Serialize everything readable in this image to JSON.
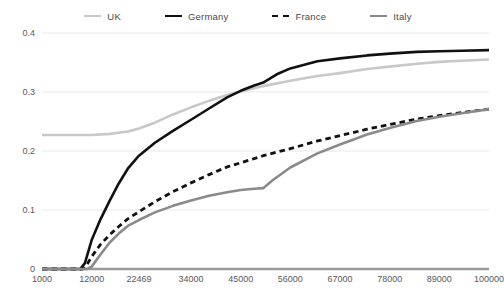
{
  "chart_data": {
    "type": "line",
    "title": "",
    "xlabel": "",
    "ylabel": "",
    "grid": true,
    "legend_position": "top",
    "xlim": [
      1000,
      100000
    ],
    "ylim": [
      0,
      0.4
    ],
    "xticks": [
      "1000",
      "12000",
      "22469",
      "34000",
      "45000",
      "56000",
      "67000",
      "78000",
      "89000",
      "100000"
    ],
    "xtick_values": [
      1000,
      12000,
      22469,
      34000,
      45000,
      56000,
      67000,
      78000,
      89000,
      100000
    ],
    "yticks": [
      "0",
      "0.1",
      "0.2",
      "0.3",
      "0.4"
    ],
    "ytick_values": [
      0,
      0.1,
      0.2,
      0.3,
      0.4
    ],
    "series": [
      {
        "name": "UK",
        "color": "#c8c8c8",
        "style": "solid",
        "width": 2.6,
        "x": [
          1000,
          8000,
          12000,
          16000,
          20000,
          22469,
          26000,
          30000,
          34000,
          38000,
          42000,
          45000,
          50000,
          56000,
          62000,
          67000,
          73000,
          78000,
          84000,
          89000,
          94000,
          100000
        ],
        "y": [
          0.227,
          0.227,
          0.227,
          0.229,
          0.233,
          0.238,
          0.248,
          0.262,
          0.274,
          0.285,
          0.295,
          0.301,
          0.31,
          0.319,
          0.327,
          0.332,
          0.339,
          0.343,
          0.348,
          0.351,
          0.353,
          0.355
        ]
      },
      {
        "name": "Germany",
        "color": "#111111",
        "style": "solid",
        "width": 2.6,
        "x": [
          1000,
          9500,
          10500,
          12000,
          14000,
          16000,
          18000,
          20000,
          22469,
          26000,
          30000,
          34000,
          38000,
          42000,
          45000,
          48000,
          50000,
          53000,
          56000,
          62000,
          67000,
          73000,
          78000,
          84000,
          89000,
          94000,
          100000
        ],
        "y": [
          0.0,
          0.0,
          0.01,
          0.049,
          0.085,
          0.116,
          0.145,
          0.17,
          0.192,
          0.214,
          0.234,
          0.253,
          0.272,
          0.291,
          0.302,
          0.311,
          0.316,
          0.33,
          0.34,
          0.352,
          0.357,
          0.362,
          0.365,
          0.368,
          0.369,
          0.37,
          0.371
        ]
      },
      {
        "name": "France",
        "color": "#111111",
        "style": "dashed",
        "width": 2.8,
        "x": [
          1000,
          10000,
          11000,
          12000,
          14000,
          16000,
          18000,
          20000,
          22469,
          26000,
          30000,
          34000,
          38000,
          42000,
          45000,
          50000,
          56000,
          62000,
          67000,
          73000,
          78000,
          84000,
          89000,
          94000,
          100000
        ],
        "y": [
          0.0,
          0.0,
          0.008,
          0.021,
          0.042,
          0.058,
          0.072,
          0.085,
          0.097,
          0.114,
          0.131,
          0.146,
          0.16,
          0.173,
          0.18,
          0.192,
          0.204,
          0.217,
          0.226,
          0.237,
          0.245,
          0.254,
          0.26,
          0.265,
          0.271
        ]
      },
      {
        "name": "Italy",
        "color": "#8a8a8a",
        "style": "solid",
        "width": 2.6,
        "x": [
          1000,
          11000,
          12000,
          14000,
          16000,
          18000,
          20000,
          22469,
          26000,
          30000,
          34000,
          38000,
          42000,
          45000,
          48000,
          50000,
          52000,
          56000,
          62000,
          67000,
          73000,
          78000,
          84000,
          89000,
          94000,
          100000
        ],
        "y": [
          0.0,
          0.0,
          0.004,
          0.025,
          0.045,
          0.06,
          0.073,
          0.083,
          0.096,
          0.107,
          0.116,
          0.124,
          0.13,
          0.134,
          0.136,
          0.137,
          0.15,
          0.172,
          0.196,
          0.211,
          0.228,
          0.239,
          0.251,
          0.258,
          0.264,
          0.271
        ]
      }
    ]
  },
  "legend": {
    "items": [
      {
        "label": "UK"
      },
      {
        "label": "Germany"
      },
      {
        "label": "France"
      },
      {
        "label": "Italy"
      }
    ]
  },
  "axes": {
    "x_labels": [
      "1000",
      "12000",
      "22469",
      "34000",
      "45000",
      "56000",
      "67000",
      "78000",
      "89000",
      "100000"
    ],
    "y_labels": [
      "0.4",
      "0.3",
      "0.2",
      "0.1",
      "0"
    ]
  },
  "colors": {
    "uk": "#c8c8c8",
    "germany": "#111111",
    "france": "#111111",
    "italy": "#8a8a8a",
    "grid": "#e8e8e8",
    "axis": "#9a9a9a",
    "text": "#595959"
  }
}
